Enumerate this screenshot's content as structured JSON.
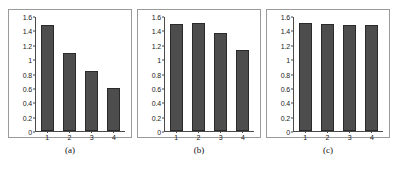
{
  "figure": {
    "background": "#ffffff",
    "bar_color": "#4d4d4d",
    "bar_edge_color": "#2a2a2a",
    "axis_color": "#4a4a4a",
    "panel_border_color": "#9a9a9a"
  },
  "chart_data": [
    {
      "type": "bar",
      "title": "",
      "caption": "(a)",
      "categories": [
        "1",
        "2",
        "3",
        "4"
      ],
      "values": [
        1.49,
        1.1,
        0.84,
        0.61
      ],
      "xlabel": "",
      "ylabel": "",
      "ylim": [
        0,
        1.6
      ],
      "yticks": [
        "1.6",
        "1.4",
        "1.2",
        "1",
        "0.8",
        "0.6",
        "0.4",
        "0.2",
        "0"
      ],
      "ytick_values": [
        1.6,
        1.4,
        1.2,
        1.0,
        0.8,
        0.6,
        0.4,
        0.2,
        0
      ],
      "grid": false,
      "legend": false
    },
    {
      "type": "bar",
      "title": "",
      "caption": "(b)",
      "categories": [
        "1",
        "2",
        "3",
        "4"
      ],
      "values": [
        1.5,
        1.51,
        1.38,
        1.14
      ],
      "xlabel": "",
      "ylabel": "",
      "ylim": [
        0,
        1.6
      ],
      "yticks": [
        "1.6",
        "1.4",
        "1.2",
        "1",
        "0.8",
        "0.6",
        "0.4",
        "0.2",
        "0"
      ],
      "ytick_values": [
        1.6,
        1.4,
        1.2,
        1.0,
        0.8,
        0.6,
        0.4,
        0.2,
        0
      ],
      "grid": false,
      "legend": false
    },
    {
      "type": "bar",
      "title": "",
      "caption": "(c)",
      "categories": [
        "1",
        "2",
        "3",
        "4"
      ],
      "values": [
        1.52,
        1.5,
        1.49,
        1.49
      ],
      "xlabel": "",
      "ylabel": "",
      "ylim": [
        0,
        1.6
      ],
      "yticks": [
        "1.6",
        "1.4",
        "1.2",
        "1",
        "0.8",
        "0.6",
        "0.4",
        "0.2",
        "0"
      ],
      "ytick_values": [
        1.6,
        1.4,
        1.2,
        1.0,
        0.8,
        0.6,
        0.4,
        0.2,
        0
      ],
      "grid": false,
      "legend": false
    }
  ]
}
